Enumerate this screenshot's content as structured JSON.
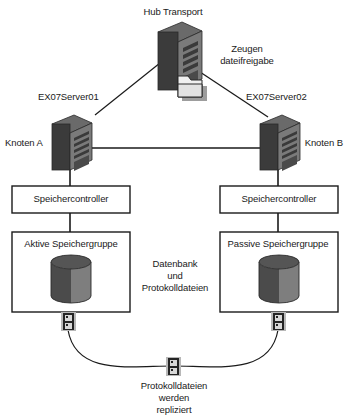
{
  "diagram": {
    "colors": {
      "stroke": "#1a1a1a",
      "text": "#1a1a1a",
      "background": "#ffffff",
      "server_front": "#3a3a3a",
      "server_side": "#6e6e6e",
      "server_top": "#555555",
      "server_slot": "#8c8c8c",
      "folder_fill": "#e8e8e8",
      "folder_shadow": "#9a9a9a",
      "cylinder_dark": "#4a4a4a",
      "cylinder_light": "#7e7e7e",
      "cylinder_top": "#555555",
      "connector_dark": "#2b2b2b",
      "connector_light": "#b5b5b5",
      "box_fill": "#ffffff"
    },
    "labels": {
      "hub_transport": "Hub Transport",
      "witness_share_line1": "Zeugen",
      "witness_share_line2": "dateifreigabe",
      "server_left": "EX07Server01",
      "server_right": "EX07Server02",
      "node_left": "Knoten A",
      "node_right": "Knoten B",
      "storage_controller_left": "Speichercontroller",
      "storage_controller_right": "Speichercontroller",
      "storage_group_active": "Aktive Speichergruppe",
      "storage_group_passive": "Passive Speichergruppe",
      "middle_note_line1": "Datenbank",
      "middle_note_line2": "und",
      "middle_note_line3": "Protokolldateien",
      "bottom_note_line1": "Protokolldateien",
      "bottom_note_line2": "werden",
      "bottom_note_line3": "repliziert"
    },
    "nodes": [
      {
        "id": "hub-transport-server",
        "kind": "server-tower",
        "label": "Hub Transport"
      },
      {
        "id": "witness-file-share",
        "kind": "folder",
        "label": "Zeugen dateifreigabe"
      },
      {
        "id": "node-a-server",
        "kind": "server-tower",
        "label": "EX07Server01 / Knoten A"
      },
      {
        "id": "node-b-server",
        "kind": "server-tower",
        "label": "EX07Server02 / Knoten B"
      },
      {
        "id": "storage-controller-left",
        "kind": "box",
        "label": "Speichercontroller"
      },
      {
        "id": "storage-controller-right",
        "kind": "box",
        "label": "Speichercontroller"
      },
      {
        "id": "storage-group-active",
        "kind": "box-with-cylinder",
        "label": "Aktive Speichergruppe"
      },
      {
        "id": "storage-group-passive",
        "kind": "box-with-cylinder",
        "label": "Passive Speichergruppe"
      },
      {
        "id": "connector-left",
        "kind": "connector-plug",
        "label": ""
      },
      {
        "id": "connector-right",
        "kind": "connector-plug",
        "label": ""
      },
      {
        "id": "connector-center",
        "kind": "connector-plug",
        "label": ""
      }
    ],
    "edges": [
      {
        "from": "hub-transport-server",
        "to": "node-a-server",
        "style": "solid"
      },
      {
        "from": "hub-transport-server",
        "to": "node-b-server",
        "style": "solid"
      },
      {
        "from": "node-a-server",
        "to": "node-b-server",
        "style": "solid"
      },
      {
        "from": "node-a-server",
        "to": "storage-controller-left",
        "style": "solid"
      },
      {
        "from": "node-b-server",
        "to": "storage-controller-right",
        "style": "solid"
      },
      {
        "from": "storage-controller-left",
        "to": "storage-group-active",
        "style": "solid"
      },
      {
        "from": "storage-controller-right",
        "to": "storage-group-passive",
        "style": "solid"
      },
      {
        "from": "connector-left",
        "to": "connector-center",
        "style": "arc"
      },
      {
        "from": "connector-center",
        "to": "connector-right",
        "style": "arc"
      }
    ]
  }
}
